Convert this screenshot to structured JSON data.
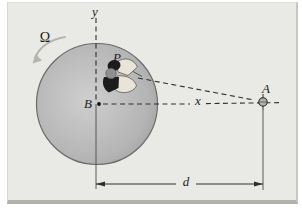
{
  "figure": {
    "labels": {
      "rotation": "Ω",
      "y_axis": "y",
      "x_axis": "x",
      "center_point": "B",
      "person_point": "P",
      "target_point": "A",
      "distance": "d"
    },
    "icons": {
      "rotation_arrow": "curved-arrow-counterclockwise",
      "target_marker": "small-circle-crosshair",
      "center_marker": "filled-dot"
    },
    "colors": {
      "page_bg": "#ffffff",
      "panel_bg": "#e9e9e5",
      "panel_bottom_edge": "#b2b2ac",
      "disk_center": "#cfcfcf",
      "disk_edge": "#9a9a9a",
      "disk_outline": "#6a6a6a",
      "line": "#2e2e2e",
      "rotation_arrow": "#b6b6ae",
      "person_dark": "#1c1c1c",
      "person_head": "#8f8f8f",
      "person_light": "#e8e4d8",
      "target_fill": "#b0b0ab"
    }
  }
}
